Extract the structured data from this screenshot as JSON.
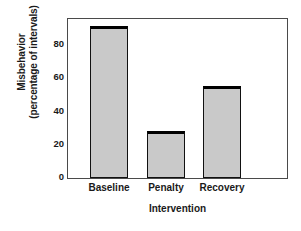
{
  "chart_data": {
    "type": "bar",
    "title": "",
    "xlabel": "Intervention",
    "ylabel": "Misbehavior (percentage of intervals)",
    "ylabel_lines": [
      "Misbehavior",
      "(percentage of intervals)"
    ],
    "categories": [
      "Baseline",
      "Penalty",
      "Recovery"
    ],
    "values": [
      91,
      28,
      55
    ],
    "ylim": [
      0,
      96
    ],
    "yticks": [
      0,
      20,
      40,
      60,
      80
    ],
    "ytick_labels": [
      "0",
      "20",
      "40",
      "60",
      "80"
    ],
    "grid": false,
    "legend": false,
    "bar_color": "#c9c9c9",
    "bar_edge_color": "#111111",
    "axis_color": "#4a4a4a",
    "text_color": "#1a1a1a",
    "background": "#ffffff"
  },
  "figure": {
    "plot": {
      "left": 67,
      "top": 18,
      "width": 221,
      "height": 161,
      "baseline_y": 177.7,
      "px_per_unit": 1.663
    },
    "bars": [
      {
        "name": "baseline",
        "x": 90,
        "width": 38
      },
      {
        "name": "penalty",
        "x": 147,
        "width": 38
      },
      {
        "name": "recovery",
        "x": 203,
        "width": 38
      }
    ],
    "xtick_centers": [
      109,
      166,
      222
    ]
  }
}
